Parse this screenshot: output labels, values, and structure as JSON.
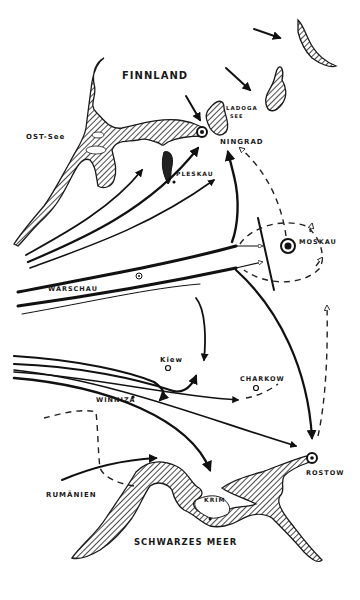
{
  "map": {
    "title": "",
    "style": "hand-drawn campaign map",
    "colors": {
      "ink": "#111111",
      "paper": "#ffffff"
    },
    "regions": [
      {
        "id": "finnland",
        "label": "FINNLAND",
        "type": "country"
      },
      {
        "id": "ostsee",
        "label": "OST-See",
        "type": "sea"
      },
      {
        "id": "ladoga",
        "label": "LADOGA",
        "sublabel": "SEE",
        "type": "lake"
      },
      {
        "id": "rumaenien",
        "label": "RUMÄNIEN",
        "type": "country"
      },
      {
        "id": "schwarzes-meer",
        "label": "SCHWARZES MEER",
        "type": "sea"
      },
      {
        "id": "krim",
        "label": "KRIM",
        "type": "peninsula"
      }
    ],
    "cities": [
      {
        "id": "leningrad",
        "label": "LENINGRAD",
        "label_visible": "NINGRAD",
        "marker": "ringed-circle"
      },
      {
        "id": "pleskau",
        "label": "PLESKAU",
        "marker": "dot"
      },
      {
        "id": "moskau",
        "label": "MOSKAU",
        "marker": "ringed-dot"
      },
      {
        "id": "warschau",
        "label": "WARSCHAU",
        "marker": "none"
      },
      {
        "id": "kiew",
        "label": "Kiew",
        "marker": "circle"
      },
      {
        "id": "charkow",
        "label": "CHARKOW",
        "marker": "circle"
      },
      {
        "id": "winniza",
        "label": "WINNIZA",
        "marker": "dot"
      },
      {
        "id": "rostow",
        "label": "ROSTOW",
        "marker": "ringed-circle"
      }
    ],
    "arrows": [
      {
        "id": "north-arrow-1",
        "from": "north",
        "to": "karelia",
        "style": "solid"
      },
      {
        "id": "north-arrow-2",
        "from": "finnland",
        "to": "ladoga-east",
        "style": "solid"
      },
      {
        "id": "north-arrow-3",
        "from": "finnland",
        "to": "leningrad",
        "style": "solid"
      },
      {
        "id": "baltic-thrust",
        "from": "baltic",
        "to": "leningrad",
        "style": "solid",
        "count": 3
      },
      {
        "id": "center-thrust",
        "from": "warschau",
        "to": "moskau",
        "style": "double-line"
      },
      {
        "id": "moskau-encircle",
        "from": "moskau",
        "to": "moskau",
        "style": "dashed"
      },
      {
        "id": "leningrad-moskau",
        "from": "moskau",
        "to": "leningrad",
        "style": "dashed"
      },
      {
        "id": "kiew-north",
        "from": "center",
        "to": "kiew",
        "style": "solid"
      },
      {
        "id": "south-thrust",
        "from": "west",
        "to": "charkow",
        "style": "triple-line"
      },
      {
        "id": "to-rostow",
        "from": "moskau",
        "to": "rostow",
        "style": "solid"
      },
      {
        "id": "rostow-retreat",
        "from": "rostow",
        "to": "north",
        "style": "dashed"
      },
      {
        "id": "krim-thrust",
        "from": "west",
        "to": "krim",
        "style": "solid"
      },
      {
        "id": "rumaenien-thrust",
        "from": "rumaenien",
        "to": "east",
        "style": "solid"
      }
    ]
  }
}
